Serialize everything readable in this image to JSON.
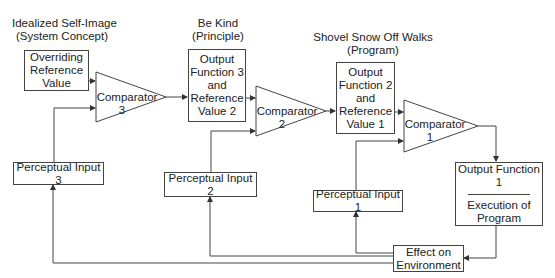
{
  "levels": [
    {
      "title": "Idealized Self-Image",
      "subtitle": "(System Concept)"
    },
    {
      "title": "Be Kind",
      "subtitle": "(Principle)"
    },
    {
      "title": "Shovel Snow Off Walks",
      "subtitle": "(Program)"
    }
  ],
  "boxes": {
    "overriding_reference": [
      "Overriding",
      "Reference",
      "Value"
    ],
    "output_function_3": [
      "Output",
      "Function 3",
      "and",
      "Reference",
      "Value 2"
    ],
    "output_function_2": [
      "Output",
      "Function 2",
      "and",
      "Reference",
      "Value 1"
    ],
    "output_function_1": {
      "title": "Output Function 1",
      "lines": [
        "Execution of",
        "Program"
      ]
    },
    "effect_on_environment": [
      "Effect on",
      "Environment"
    ],
    "perceptual_input_3": "Perceptual Input 3",
    "perceptual_input_2": "Perceptual Input 2",
    "perceptual_input_1": "Perceptual Input 1"
  },
  "comparators": [
    {
      "label": "Comparator",
      "number": "3"
    },
    {
      "label": "Comparator",
      "number": "2"
    },
    {
      "label": "Comparator",
      "number": "1"
    }
  ],
  "colors": {
    "stroke": "#444444",
    "text": "#222222",
    "background": "#ffffff"
  }
}
